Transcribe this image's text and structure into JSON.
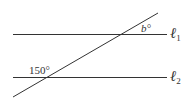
{
  "diagram": {
    "type": "parallel-lines-transversal",
    "lines": [
      {
        "id": "l1",
        "label_letter": "ℓ",
        "label_sub": "1"
      },
      {
        "id": "l2",
        "label_letter": "ℓ",
        "label_sub": "2"
      }
    ],
    "angles": [
      {
        "label": "b°",
        "at": "intersection with ℓ1"
      },
      {
        "label": "150°",
        "at": "intersection with ℓ2"
      }
    ],
    "colors": {
      "stroke": "#333333",
      "background": "#ffffff"
    }
  }
}
